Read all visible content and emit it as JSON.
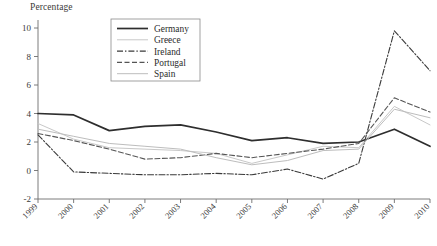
{
  "chart": {
    "type": "line",
    "ylabel": "Percentage",
    "legend_position": "top-center"
  },
  "chart_data": {
    "type": "line",
    "title": "",
    "xlabel": "",
    "ylabel": "Percentage",
    "x": [
      "1999",
      "2000",
      "2001",
      "2002",
      "2003",
      "2004",
      "2005",
      "2006",
      "2007",
      "2008",
      "2009",
      "2010"
    ],
    "ylim": [
      -2,
      10
    ],
    "yticks": [
      -2,
      0,
      2,
      4,
      6,
      8,
      10
    ],
    "ytick_labels": [
      "-2",
      "0",
      "2",
      "4",
      "6",
      "8",
      "10"
    ],
    "grid": false,
    "legend": [
      "Germany",
      "Greece",
      "Ireland",
      "Portugal",
      "Spain"
    ],
    "series": [
      {
        "name": "Germany",
        "style": "solid",
        "color": "#2e2e2e",
        "values": [
          4.0,
          3.9,
          2.8,
          3.1,
          3.2,
          2.7,
          2.1,
          2.3,
          1.9,
          2.0,
          2.9,
          1.7
        ]
      },
      {
        "name": "Greece",
        "style": "solid-light",
        "color": "#c8c8c8",
        "values": [
          3.3,
          2.2,
          1.6,
          1.5,
          1.4,
          1.2,
          0.5,
          1.1,
          1.7,
          1.6,
          4.5,
          3.2
        ]
      },
      {
        "name": "Ireland",
        "style": "dash-dot",
        "color": "#3a3a3a",
        "values": [
          2.5,
          -0.1,
          -0.2,
          -0.3,
          -0.3,
          -0.2,
          -0.3,
          0.1,
          -0.6,
          0.5,
          9.8,
          7.0
        ]
      },
      {
        "name": "Portugal",
        "style": "dashed",
        "color": "#555555",
        "values": [
          2.6,
          2.1,
          1.5,
          0.8,
          0.9,
          1.2,
          0.9,
          1.2,
          1.5,
          1.9,
          5.1,
          4.1
        ]
      },
      {
        "name": "Spain",
        "style": "solid-light2",
        "color": "#bdbdbd",
        "values": [
          2.9,
          2.4,
          1.9,
          1.7,
          1.5,
          0.9,
          0.4,
          0.7,
          1.4,
          1.5,
          4.3,
          3.7
        ]
      }
    ]
  }
}
